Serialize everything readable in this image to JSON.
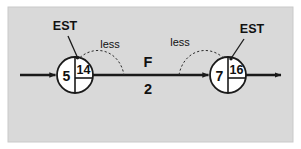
{
  "figure": {
    "background_color": "#d9d9d9",
    "page_color": "#ffffff",
    "line_color": "#1a1a1a"
  },
  "nodes": [
    {
      "id": "node-left",
      "left_value": "5",
      "right_value": "14",
      "cx": 75,
      "cy": 75,
      "r": 18,
      "callout": "EST"
    },
    {
      "id": "node-right",
      "left_value": "7",
      "right_value": "16",
      "cx": 228,
      "cy": 75,
      "r": 18,
      "callout": "EST"
    }
  ],
  "activity": {
    "name": "F",
    "duration": "2"
  },
  "arcs": [
    {
      "id": "arc-left",
      "label": "less"
    },
    {
      "id": "arc-right",
      "label": "less"
    }
  ],
  "callouts": {
    "left_label": "EST",
    "right_label": "EST"
  }
}
